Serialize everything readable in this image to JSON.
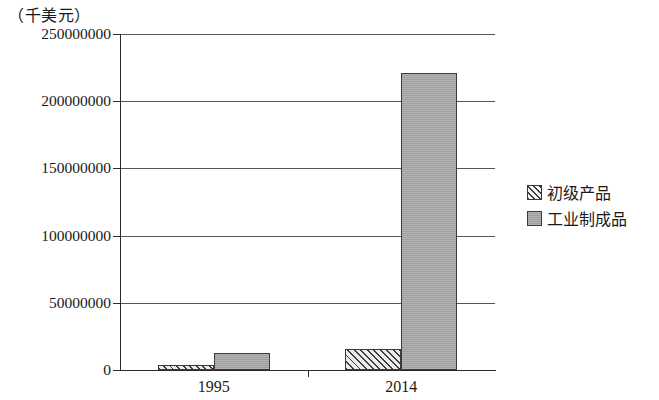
{
  "chart_data": {
    "type": "bar",
    "title": "",
    "unit_label": "（千美元）",
    "xlabel": "",
    "ylabel": "",
    "categories": [
      "1995",
      "2014"
    ],
    "series": [
      {
        "name": "初级产品",
        "values": [
          3500000,
          15500000
        ],
        "fill": "hatch"
      },
      {
        "name": "工业制成品",
        "values": [
          12500000,
          221000000
        ],
        "fill": "solid"
      }
    ],
    "ylim": [
      0,
      250000000
    ],
    "ytick_values": [
      0,
      50000000,
      100000000,
      150000000,
      200000000,
      250000000
    ],
    "ytick_labels": [
      "0",
      "50000000",
      "100000000",
      "150000000",
      "200000000",
      "250000000"
    ],
    "grid": true,
    "legend_position": "right",
    "colors": {
      "solid_fill": "#a8a8a8",
      "hatch_fill": "#ececec",
      "bar_border": "#3a3a3a",
      "gridline": "#555555",
      "axis": "#2b2b2b",
      "text": "#1a1a1a",
      "background": "#ffffff"
    }
  },
  "legend": {
    "items": [
      {
        "label": "初级产品",
        "fill": "hatch"
      },
      {
        "label": "工业制成品",
        "fill": "solid"
      }
    ]
  }
}
